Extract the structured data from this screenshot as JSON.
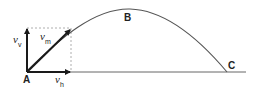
{
  "diagram": {
    "type": "projectile-trajectory",
    "points": {
      "launch": "A",
      "apex": "B",
      "landing": "C"
    },
    "vectors": {
      "vertical": {
        "symbol": "v",
        "subscript": "v"
      },
      "magnitude": {
        "symbol": "v",
        "subscript": "m"
      },
      "horizontal": {
        "symbol": "v",
        "subscript": "h"
      }
    },
    "colors": {
      "line": "#444444",
      "arrow": "#1a1a1a",
      "dashed": "#999999",
      "background": "#ffffff"
    }
  }
}
